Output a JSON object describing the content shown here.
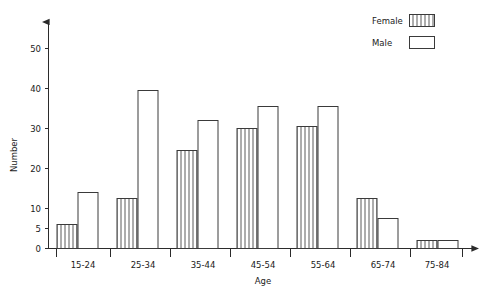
{
  "chart_data": {
    "type": "bar",
    "title": "",
    "subtitle": "",
    "xlabel": "Age",
    "ylabel": "Number",
    "categories": [
      "15-24",
      "25-34",
      "35-44",
      "45-54",
      "55-64",
      "65-74",
      "75-84"
    ],
    "series": [
      {
        "name": "Female",
        "pattern": "vertical-hatch",
        "values": [
          6,
          12.5,
          24.5,
          30,
          30.5,
          12.5,
          2
        ]
      },
      {
        "name": "Male",
        "pattern": "open",
        "values": [
          14,
          39.5,
          32,
          35.5,
          35.5,
          7.5,
          2
        ]
      }
    ],
    "ylim": [
      0,
      55
    ],
    "yticks": [
      0,
      5,
      10,
      20,
      30,
      40,
      50
    ],
    "ytick_labels": [
      "0",
      "5",
      "10",
      "20",
      "30",
      "40",
      "50"
    ],
    "grid": false,
    "legend_position": "top-right",
    "legend_entries": [
      "Female",
      "Male"
    ],
    "colors": {
      "axis": "#2b2b2b",
      "bar_stroke": "#3a3a3a",
      "bar_fill_male": "#ffffff",
      "bar_fill_female": "#ffffff",
      "hatch_stroke": "#5a5a5a",
      "text": "#1a1a1a",
      "background": "#ffffff"
    }
  },
  "legend": {
    "female_label": "Female",
    "male_label": "Male"
  },
  "axes": {
    "y_title": "Number",
    "x_title": "Age"
  }
}
